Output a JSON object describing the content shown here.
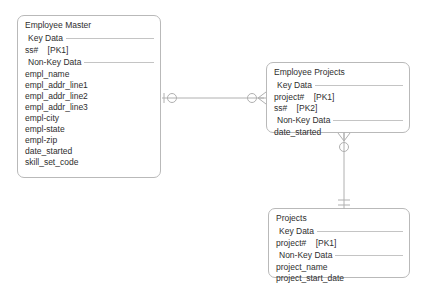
{
  "diagram": {
    "type": "entity-relationship-diagram",
    "notation": "crows-foot",
    "background_color": "#ffffff",
    "line_color": "#b0b0b0",
    "text_color": "#2e2e2e",
    "border_color": "#b9b9b9"
  },
  "entities": [
    {
      "id": "employee-master",
      "title": "Employee Master",
      "key_section_label": "Key Data",
      "key_attributes": [
        {
          "name": "ss#",
          "key": "[PK1]"
        }
      ],
      "nonkey_section_label": "Non-Key Data",
      "nonkey_attributes": [
        "empl_name",
        "empl_addr_line1",
        "empl_addr_line2",
        "empl_addr_line3",
        "empl-city",
        "empl-state",
        "empl-zip",
        "date_started",
        "skill_set_code"
      ]
    },
    {
      "id": "employee-projects",
      "title": "Employee Projects",
      "key_section_label": "Key Data",
      "key_attributes": [
        {
          "name": "project#",
          "key": "[PK1]"
        },
        {
          "name": "ss#",
          "key": "[PK2]"
        }
      ],
      "nonkey_section_label": "Non-Key Data",
      "nonkey_attributes": [
        "date_started"
      ]
    },
    {
      "id": "projects",
      "title": "Projects",
      "key_section_label": "Key Data",
      "key_attributes": [
        {
          "name": "project#",
          "key": "[PK1]"
        }
      ],
      "nonkey_section_label": "Non-Key Data",
      "nonkey_attributes": [
        "project_name",
        "project_start_date"
      ]
    }
  ],
  "relationships": [
    {
      "id": "employee-master-to-employee-projects",
      "from": "employee-master",
      "to": "employee-projects",
      "orientation": "horizontal",
      "from_cardinality": "one-and-only-one",
      "to_cardinality": "zero-or-many"
    },
    {
      "id": "employee-projects-to-projects",
      "from": "employee-projects",
      "to": "projects",
      "orientation": "vertical",
      "from_cardinality": "zero-or-many",
      "to_cardinality": "one-and-only-one"
    }
  ]
}
